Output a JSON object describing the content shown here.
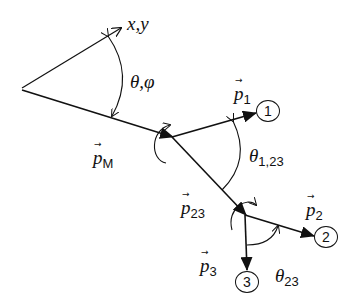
{
  "diagram": {
    "colors": {
      "stroke": "#111111",
      "background": "#ffffff"
    },
    "labels": {
      "axis": "x,y",
      "theta_phi": {
        "main": "θ,φ"
      },
      "p_M": {
        "main": "p",
        "sub": "M"
      },
      "p_1": {
        "main": "p",
        "sub": "1"
      },
      "p_2": {
        "main": "p",
        "sub": "2"
      },
      "p_3": {
        "main": "p",
        "sub": "3"
      },
      "p_23": {
        "main": "p",
        "sub": "23"
      },
      "theta_1_23": {
        "main": "θ",
        "sub": "1,23"
      },
      "theta_23": {
        "main": "θ",
        "sub": "23"
      },
      "vector_arrow": "→"
    },
    "nodes": [
      {
        "id": "1",
        "label": "1"
      },
      {
        "id": "2",
        "label": "2"
      },
      {
        "id": "3",
        "label": "3"
      }
    ]
  }
}
